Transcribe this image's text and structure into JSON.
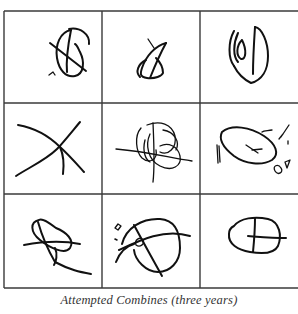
{
  "figure": {
    "caption": "Attempted Combines (three years)",
    "grid": {
      "rows": 3,
      "columns": 3
    },
    "cells": [
      {
        "row": 1,
        "col": 1,
        "description": "circle crossed by diagonal line with inner hook"
      },
      {
        "row": 1,
        "col": 2,
        "description": "triangular loop with crossing stroke"
      },
      {
        "row": 1,
        "col": 3,
        "description": "oval with inner leaf shape and vertical stroke"
      },
      {
        "row": 2,
        "col": 1,
        "description": "two crossing lines (X)"
      },
      {
        "row": 2,
        "col": 2,
        "description": "tangled loops crossed by horizontal and vertical lines"
      },
      {
        "row": 2,
        "col": 3,
        "description": "closed oval with small cross inside and scattered marks"
      },
      {
        "row": 3,
        "col": 1,
        "description": "looping scribble crossed by lines"
      },
      {
        "row": 3,
        "col": 2,
        "description": "circle crossed by lines with small circle and dots"
      },
      {
        "row": 3,
        "col": 3,
        "description": "rounded shape divided by a cross"
      }
    ],
    "colors": {
      "ink": "#111111",
      "grid": "#3a3a3a",
      "background": "#ffffff",
      "caption": "#333333"
    }
  }
}
